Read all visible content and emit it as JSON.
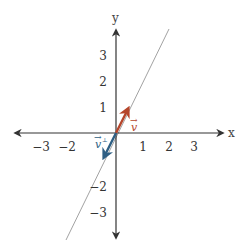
{
  "axes": {
    "x_label": "x",
    "y_label": "y",
    "x_ticks": [
      "−3",
      "−2",
      "1",
      "2",
      "3"
    ],
    "y_ticks_positive": [
      "3",
      "2",
      "1"
    ],
    "y_ticks_negative": [
      "−2",
      "−3"
    ],
    "axis_color": "#333333"
  },
  "line": {
    "description": "line through origin, slope 2",
    "color": "#888888"
  },
  "vectors": [
    {
      "name": "v",
      "label": "v",
      "arrow_mark": "→",
      "color": "#b5452b",
      "components": [
        0.5,
        1
      ]
    },
    {
      "name": "v-perp",
      "label": "v",
      "arrow_mark": "→",
      "superscript": "⊥",
      "color": "#2e5f84",
      "components": [
        -0.5,
        -1
      ]
    }
  ]
}
